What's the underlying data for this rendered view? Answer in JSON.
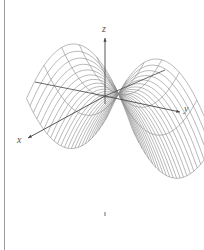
{
  "figure": {
    "type": "3d-surface-wireframe",
    "surface": "saddle (hyperbolic paraboloid)",
    "colors": {
      "mesh": "#8a8a8a",
      "axis": "#444444",
      "border": "#9a9a9a",
      "background": "#ffffff"
    }
  },
  "axes": {
    "x": {
      "label": "x"
    },
    "y": {
      "label": "y"
    },
    "z": {
      "label": "z"
    }
  }
}
